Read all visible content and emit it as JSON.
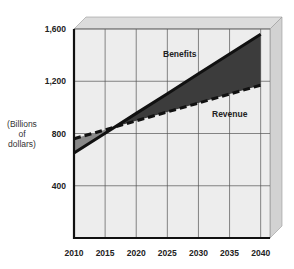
{
  "chart_data": {
    "type": "line",
    "title": "",
    "xlabel": "",
    "ylabel": "(Billions of dollars)",
    "ylabel_lines": [
      "(Billions",
      "of",
      "dollars)"
    ],
    "x": [
      2010,
      2015,
      2020,
      2025,
      2030,
      2035,
      2040
    ],
    "x_tick_labels": [
      "2010",
      "2015",
      "2020",
      "2025",
      "2030",
      "2035",
      "2040"
    ],
    "y_tick_labels": [
      "400",
      "800",
      "1,200",
      "1,600"
    ],
    "y_ticks": [
      400,
      800,
      1200,
      1600
    ],
    "ylim": [
      0,
      1600
    ],
    "xlim": [
      2010,
      2041.5
    ],
    "grid": true,
    "series": [
      {
        "name": "Benefits",
        "style": "solid",
        "values": [
          650,
          802,
          954,
          1105,
          1257,
          1408,
          1560
        ]
      },
      {
        "name": "Revenue",
        "style": "dashed",
        "values": [
          760,
          828,
          897,
          965,
          1033,
          1102,
          1170
        ]
      }
    ],
    "annotations": [
      {
        "text": "Benefits",
        "x": 2027,
        "y": 1420
      },
      {
        "text": "Revenue",
        "x": 2033,
        "y": 830
      }
    ],
    "shaded_region": "between Benefits and Revenue"
  },
  "colors": {
    "plot_bg": "#ededed",
    "grid": "#555555",
    "frame_depth": "#dcdcdc",
    "shade": "#3c3c3c",
    "shade_early": "#888888",
    "line": "#111111"
  }
}
